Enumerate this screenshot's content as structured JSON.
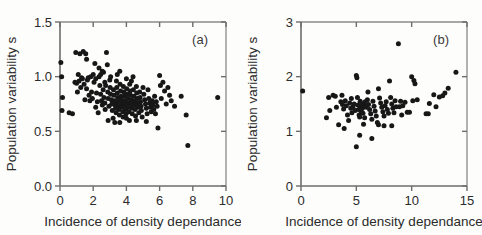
{
  "figure": {
    "panels": [
      "a",
      "b"
    ],
    "marker_color": "#171717",
    "axis_color": "#6d6d6d",
    "background": "#fdfdfc"
  },
  "chart_data": [
    {
      "type": "scatter",
      "panel_label": "(a)",
      "title": "",
      "xlabel": "Incidence of density dependance",
      "ylabel": "Population variability s",
      "xlim": [
        0,
        10
      ],
      "ylim": [
        0.0,
        1.5
      ],
      "xticks": [
        0,
        2,
        4,
        6,
        8,
        10
      ],
      "xticklabels": [
        "0",
        "2",
        "4",
        "6",
        "8",
        "10"
      ],
      "yticks": [
        0.0,
        0.5,
        1.0,
        1.5
      ],
      "yticklabels": [
        "0.0",
        "0.5",
        "1.0",
        "1.5"
      ],
      "grid": false,
      "legend": null,
      "points": [
        [
          0.05,
          1.13
        ],
        [
          0.1,
          1.0
        ],
        [
          0.15,
          0.81
        ],
        [
          0.12,
          0.69
        ],
        [
          0.55,
          0.67
        ],
        [
          0.75,
          0.66
        ],
        [
          0.95,
          1.22
        ],
        [
          1.0,
          0.94
        ],
        [
          1.05,
          0.86
        ],
        [
          1.15,
          0.96
        ],
        [
          1.2,
          1.21
        ],
        [
          1.3,
          0.99
        ],
        [
          1.35,
          0.98
        ],
        [
          1.4,
          1.23
        ],
        [
          1.45,
          0.93
        ],
        [
          1.5,
          0.79
        ],
        [
          1.55,
          1.21
        ],
        [
          1.6,
          1.16
        ],
        [
          1.65,
          0.97
        ],
        [
          1.7,
          0.99
        ],
        [
          1.75,
          0.83
        ],
        [
          1.8,
          0.78
        ],
        [
          1.85,
          1.0
        ],
        [
          1.9,
          0.86
        ],
        [
          1.95,
          0.8
        ],
        [
          2.0,
          1.02
        ],
        [
          2.05,
          0.95
        ],
        [
          2.1,
          1.12
        ],
        [
          2.15,
          0.72
        ],
        [
          2.2,
          0.85
        ],
        [
          2.25,
          0.77
        ],
        [
          2.3,
          0.67
        ],
        [
          2.35,
          1.0
        ],
        [
          2.4,
          0.92
        ],
        [
          2.45,
          0.84
        ],
        [
          2.5,
          0.78
        ],
        [
          2.55,
          0.74
        ],
        [
          2.6,
          0.88
        ],
        [
          2.62,
          1.04
        ],
        [
          2.65,
          0.81
        ],
        [
          2.7,
          0.76
        ],
        [
          2.72,
          0.7
        ],
        [
          2.75,
          0.92
        ],
        [
          2.8,
          1.22
        ],
        [
          2.85,
          1.11
        ],
        [
          2.88,
          0.86
        ],
        [
          2.9,
          0.8
        ],
        [
          2.95,
          0.73
        ],
        [
          3.0,
          0.97
        ],
        [
          3.02,
          0.9
        ],
        [
          3.05,
          0.84
        ],
        [
          3.1,
          0.79
        ],
        [
          3.12,
          0.75
        ],
        [
          3.15,
          0.69
        ],
        [
          3.2,
          0.62
        ],
        [
          3.22,
          0.88
        ],
        [
          3.25,
          0.83
        ],
        [
          3.3,
          0.78
        ],
        [
          3.32,
          0.74
        ],
        [
          3.35,
          0.71
        ],
        [
          3.38,
          0.67
        ],
        [
          3.4,
          0.96
        ],
        [
          3.42,
          0.9
        ],
        [
          3.45,
          0.85
        ],
        [
          3.48,
          0.81
        ],
        [
          3.5,
          0.77
        ],
        [
          3.52,
          0.73
        ],
        [
          3.55,
          0.7
        ],
        [
          3.58,
          0.65
        ],
        [
          3.6,
          1.05
        ],
        [
          3.62,
          0.93
        ],
        [
          3.65,
          0.87
        ],
        [
          3.68,
          0.82
        ],
        [
          3.7,
          0.79
        ],
        [
          3.72,
          0.75
        ],
        [
          3.75,
          0.72
        ],
        [
          3.78,
          0.68
        ],
        [
          3.8,
          0.63
        ],
        [
          3.82,
          0.91
        ],
        [
          3.85,
          0.86
        ],
        [
          3.88,
          0.82
        ],
        [
          3.9,
          0.78
        ],
        [
          3.92,
          0.74
        ],
        [
          3.95,
          0.7
        ],
        [
          3.98,
          0.66
        ],
        [
          4.0,
          0.98
        ],
        [
          4.02,
          0.89
        ],
        [
          4.05,
          0.84
        ],
        [
          4.08,
          0.8
        ],
        [
          4.1,
          0.76
        ],
        [
          4.12,
          0.72
        ],
        [
          4.15,
          0.68
        ],
        [
          4.18,
          0.6
        ],
        [
          4.2,
          0.93
        ],
        [
          4.22,
          0.87
        ],
        [
          4.25,
          0.83
        ],
        [
          4.28,
          0.79
        ],
        [
          4.3,
          0.75
        ],
        [
          4.32,
          0.71
        ],
        [
          4.35,
          0.66
        ],
        [
          4.4,
          1.0
        ],
        [
          4.42,
          0.88
        ],
        [
          4.45,
          0.82
        ],
        [
          4.48,
          0.78
        ],
        [
          4.5,
          0.74
        ],
        [
          4.52,
          0.7
        ],
        [
          4.55,
          0.64
        ],
        [
          4.6,
          0.91
        ],
        [
          4.62,
          0.85
        ],
        [
          4.65,
          0.8
        ],
        [
          4.68,
          0.76
        ],
        [
          4.7,
          0.72
        ],
        [
          4.75,
          0.67
        ],
        [
          4.8,
          0.86
        ],
        [
          4.82,
          0.81
        ],
        [
          4.85,
          0.77
        ],
        [
          4.88,
          0.73
        ],
        [
          4.9,
          0.69
        ],
        [
          4.95,
          0.63
        ],
        [
          5.0,
          0.9
        ],
        [
          5.05,
          0.84
        ],
        [
          5.1,
          0.79
        ],
        [
          5.15,
          0.75
        ],
        [
          5.2,
          0.71
        ],
        [
          5.25,
          0.66
        ],
        [
          5.3,
          0.88
        ],
        [
          5.35,
          0.8
        ],
        [
          5.4,
          0.76
        ],
        [
          5.45,
          0.72
        ],
        [
          5.5,
          0.68
        ],
        [
          5.55,
          0.78
        ],
        [
          5.6,
          0.74
        ],
        [
          5.65,
          0.7
        ],
        [
          5.7,
          0.82
        ],
        [
          5.75,
          0.66
        ],
        [
          5.8,
          0.77
        ],
        [
          5.85,
          0.73
        ],
        [
          5.9,
          0.53
        ],
        [
          6.0,
          1.01
        ],
        [
          6.05,
          0.92
        ],
        [
          6.1,
          0.8
        ],
        [
          6.2,
          0.95
        ],
        [
          6.3,
          0.87
        ],
        [
          6.4,
          0.75
        ],
        [
          6.5,
          0.9
        ],
        [
          6.6,
          0.83
        ],
        [
          6.7,
          0.78
        ],
        [
          6.9,
          0.73
        ],
        [
          7.3,
          0.82
        ],
        [
          7.6,
          0.65
        ],
        [
          7.7,
          0.37
        ],
        [
          9.5,
          0.81
        ],
        [
          2.35,
          1.08
        ],
        [
          2.55,
          1.05
        ],
        [
          3.05,
          1.0
        ],
        [
          3.3,
          0.58
        ],
        [
          3.6,
          0.58
        ],
        [
          2.9,
          0.6
        ],
        [
          4.0,
          0.62
        ],
        [
          4.6,
          0.6
        ],
        [
          1.25,
          0.9
        ],
        [
          1.6,
          0.89
        ],
        [
          2.15,
          0.98
        ],
        [
          2.45,
          1.02
        ],
        [
          5.2,
          0.59
        ],
        [
          0.9,
          0.95
        ],
        [
          1.1,
          1.02
        ],
        [
          2.7,
          0.95
        ],
        [
          3.45,
          1.02
        ],
        [
          4.3,
          0.96
        ]
      ]
    },
    {
      "type": "scatter",
      "panel_label": "(b)",
      "title": "",
      "xlabel": "Incidence of density dependance",
      "ylabel": "Population variability s",
      "xlim": [
        0,
        15
      ],
      "ylim": [
        0,
        3
      ],
      "xticks": [
        0,
        5,
        10,
        15
      ],
      "xticklabels": [
        "0",
        "5",
        "10",
        "15"
      ],
      "yticks": [
        0,
        1,
        2,
        3
      ],
      "yticklabels": [
        "0",
        "1",
        "2",
        "3"
      ],
      "grid": false,
      "legend": null,
      "points": [
        [
          0.15,
          1.74
        ],
        [
          2.3,
          1.25
        ],
        [
          2.5,
          1.62
        ],
        [
          2.6,
          1.38
        ],
        [
          2.9,
          1.66
        ],
        [
          3.1,
          1.64
        ],
        [
          3.2,
          1.44
        ],
        [
          3.4,
          1.12
        ],
        [
          3.6,
          1.54
        ],
        [
          3.7,
          1.66
        ],
        [
          3.75,
          1.49
        ],
        [
          3.85,
          1.41
        ],
        [
          3.9,
          1.05
        ],
        [
          4.0,
          1.56
        ],
        [
          4.1,
          1.47
        ],
        [
          4.2,
          1.3
        ],
        [
          4.3,
          1.2
        ],
        [
          4.4,
          1.52
        ],
        [
          4.5,
          1.42
        ],
        [
          4.6,
          1.34
        ],
        [
          4.7,
          1.45
        ],
        [
          4.8,
          1.5
        ],
        [
          4.9,
          1.38
        ],
        [
          5.0,
          2.02
        ],
        [
          5.05,
          1.98
        ],
        [
          5.1,
          1.62
        ],
        [
          5.15,
          1.48
        ],
        [
          5.2,
          1.4
        ],
        [
          5.25,
          1.3
        ],
        [
          5.3,
          1.26
        ],
        [
          5.35,
          1.55
        ],
        [
          5.4,
          1.45
        ],
        [
          5.45,
          1.36
        ],
        [
          5.5,
          1.5
        ],
        [
          5.55,
          1.42
        ],
        [
          5.6,
          1.33
        ],
        [
          5.65,
          1.13
        ],
        [
          5.7,
          1.47
        ],
        [
          5.8,
          1.54
        ],
        [
          5.9,
          1.44
        ],
        [
          5.0,
          0.72
        ],
        [
          5.3,
          0.93
        ],
        [
          6.0,
          1.58
        ],
        [
          6.1,
          1.49
        ],
        [
          6.2,
          1.4
        ],
        [
          6.3,
          1.32
        ],
        [
          6.4,
          1.22
        ],
        [
          6.5,
          1.55
        ],
        [
          6.6,
          1.46
        ],
        [
          6.7,
          1.37
        ],
        [
          6.8,
          1.28
        ],
        [
          6.9,
          1.16
        ],
        [
          6.4,
          0.87
        ],
        [
          7.0,
          1.78
        ],
        [
          7.1,
          1.61
        ],
        [
          7.2,
          1.52
        ],
        [
          7.3,
          1.44
        ],
        [
          7.4,
          1.36
        ],
        [
          7.5,
          1.28
        ],
        [
          7.6,
          1.47
        ],
        [
          7.7,
          1.54
        ],
        [
          7.8,
          1.4
        ],
        [
          7.9,
          1.33
        ],
        [
          7.0,
          1.12
        ],
        [
          7.5,
          1.1
        ],
        [
          8.0,
          1.92
        ],
        [
          8.1,
          1.62
        ],
        [
          8.2,
          1.5
        ],
        [
          8.3,
          1.42
        ],
        [
          8.4,
          1.34
        ],
        [
          8.5,
          1.56
        ],
        [
          8.6,
          1.45
        ],
        [
          8.8,
          2.6
        ],
        [
          8.2,
          1.1
        ],
        [
          9.0,
          1.55
        ],
        [
          9.2,
          1.47
        ],
        [
          9.4,
          1.53
        ],
        [
          9.6,
          1.35
        ],
        [
          9.8,
          1.35
        ],
        [
          10.0,
          2.0
        ],
        [
          10.2,
          1.93
        ],
        [
          10.3,
          1.87
        ],
        [
          10.1,
          1.56
        ],
        [
          10.5,
          1.58
        ],
        [
          11.3,
          1.32
        ],
        [
          11.5,
          1.32
        ],
        [
          11.6,
          1.51
        ],
        [
          12.0,
          1.67
        ],
        [
          12.2,
          1.45
        ],
        [
          12.5,
          1.63
        ],
        [
          12.8,
          1.65
        ],
        [
          13.0,
          1.7
        ],
        [
          13.3,
          1.79
        ],
        [
          14.0,
          2.08
        ],
        [
          6.05,
          1.72
        ],
        [
          4.55,
          1.6
        ],
        [
          5.75,
          1.25
        ],
        [
          8.9,
          1.45
        ],
        [
          9.1,
          1.3
        ]
      ]
    }
  ]
}
